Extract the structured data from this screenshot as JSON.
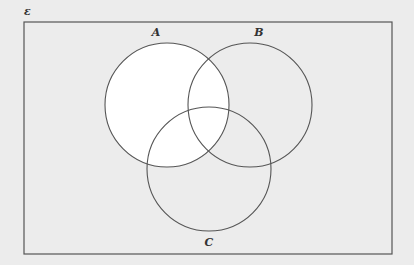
{
  "diagram": {
    "type": "venn",
    "universal_label": "ε",
    "sets": [
      {
        "name": "A",
        "cx": 167,
        "cy": 105,
        "r": 62,
        "label_x": 156,
        "label_y": 36
      },
      {
        "name": "B",
        "cx": 250,
        "cy": 105,
        "r": 62,
        "label_x": 259,
        "label_y": 36
      },
      {
        "name": "C",
        "cx": 209,
        "cy": 169,
        "r": 62,
        "label_x": 209,
        "label_y": 246
      }
    ],
    "shaded_region": "A",
    "colors": {
      "background": "#ececec",
      "shaded": "#ffffff",
      "stroke": "#555555"
    }
  }
}
